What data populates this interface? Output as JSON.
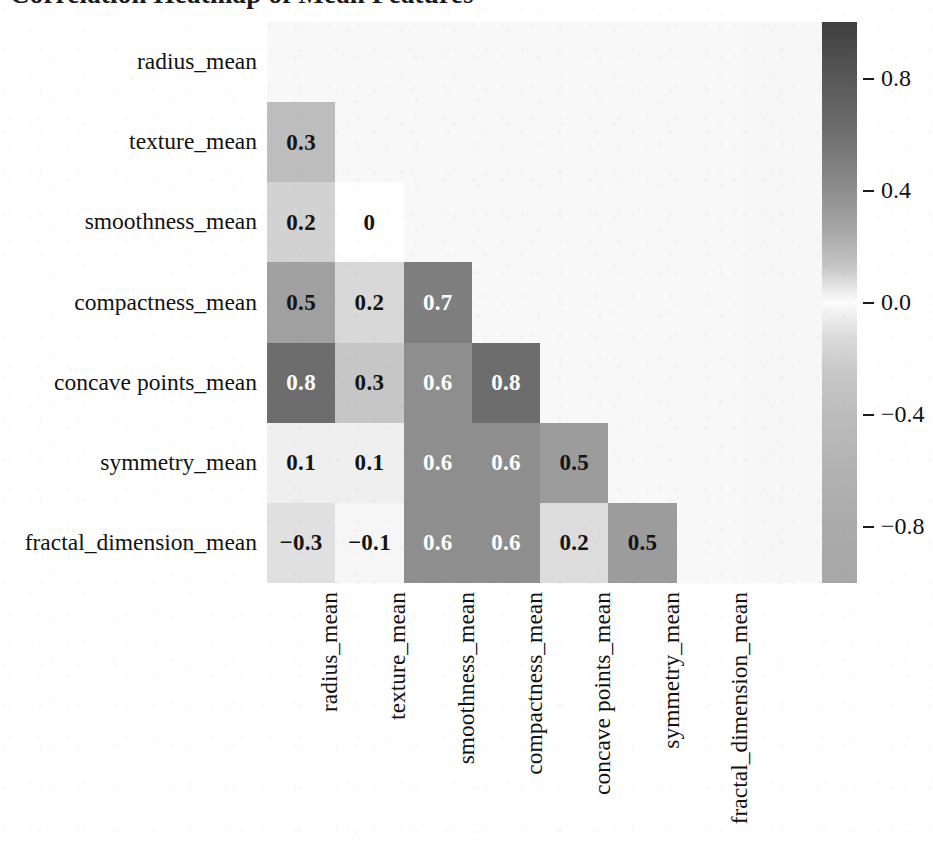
{
  "title": "Correlation Heatmap of Mean Features",
  "chart_data": {
    "type": "heatmap",
    "title": "Correlation Heatmap of Mean Features",
    "xlabel": "",
    "ylabel": "",
    "grid": false,
    "mask": "lower-triangle (diagonal and upper triangle hidden)",
    "colormap": "diverging grayscale (white at 0, dark at +1, gray at -1)",
    "colorbar": {
      "position": "right",
      "vmin": -1.0,
      "vmax": 1.0,
      "ticks": [
        "0.8",
        "0.4",
        "0.0",
        "-0.4",
        "-0.8"
      ],
      "tick_values": [
        0.8,
        0.4,
        0.0,
        -0.4,
        -0.8
      ]
    },
    "categories": [
      "radius_mean",
      "texture_mean",
      "smoothness_mean",
      "compactness_mean",
      "concave points_mean",
      "symmetry_mean",
      "fractal_dimension_mean"
    ],
    "row_labels": [
      "radius_mean",
      "texture_mean",
      "smoothness_mean",
      "compactness_mean",
      "concave points_mean",
      "symmetry_mean",
      "fractal_dimension_mean"
    ],
    "column_labels": [
      "radius_mean",
      "texture_mean",
      "smoothness_mean",
      "compactness_mean",
      "concave points_mean",
      "symmetry_mean",
      "fractal_dimension_mean"
    ],
    "matrix": [
      [
        null,
        null,
        null,
        null,
        null,
        null,
        null
      ],
      [
        0.3,
        null,
        null,
        null,
        null,
        null,
        null
      ],
      [
        0.2,
        0.0,
        null,
        null,
        null,
        null,
        null
      ],
      [
        0.5,
        0.2,
        0.7,
        null,
        null,
        null,
        null
      ],
      [
        0.8,
        0.3,
        0.6,
        0.8,
        null,
        null,
        null
      ],
      [
        0.1,
        0.1,
        0.6,
        0.6,
        0.5,
        null,
        null
      ],
      [
        -0.3,
        -0.1,
        0.6,
        0.6,
        0.2,
        0.5,
        null
      ]
    ],
    "cells": [
      {
        "row": 1,
        "col": 0,
        "label": "0.3",
        "value": 0.3,
        "color": "#bdbdbd",
        "text_color": "#141414"
      },
      {
        "row": 2,
        "col": 0,
        "label": "0.2",
        "value": 0.2,
        "color": "#d2d2d2",
        "text_color": "#141414"
      },
      {
        "row": 2,
        "col": 1,
        "label": "0",
        "value": 0.0,
        "color": "#ffffff",
        "text_color": "#141414"
      },
      {
        "row": 3,
        "col": 0,
        "label": "0.5",
        "value": 0.5,
        "color": "#a0a0a0",
        "text_color": "#141414"
      },
      {
        "row": 3,
        "col": 1,
        "label": "0.2",
        "value": 0.2,
        "color": "#d8d8d8",
        "text_color": "#141414"
      },
      {
        "row": 3,
        "col": 2,
        "label": "0.7",
        "value": 0.7,
        "color": "#7f7f7f",
        "text_color": "#ffffff"
      },
      {
        "row": 4,
        "col": 0,
        "label": "0.8",
        "value": 0.8,
        "color": "#6d6d6d",
        "text_color": "#ffffff"
      },
      {
        "row": 4,
        "col": 1,
        "label": "0.3",
        "value": 0.3,
        "color": "#c6c6c6",
        "text_color": "#141414"
      },
      {
        "row": 4,
        "col": 2,
        "label": "0.6",
        "value": 0.6,
        "color": "#8e8e8e",
        "text_color": "#ffffff"
      },
      {
        "row": 4,
        "col": 3,
        "label": "0.8",
        "value": 0.8,
        "color": "#6d6d6d",
        "text_color": "#ffffff"
      },
      {
        "row": 5,
        "col": 0,
        "label": "0.1",
        "value": 0.1,
        "color": "#efefef",
        "text_color": "#141414"
      },
      {
        "row": 5,
        "col": 1,
        "label": "0.1",
        "value": 0.1,
        "color": "#efefef",
        "text_color": "#141414"
      },
      {
        "row": 5,
        "col": 2,
        "label": "0.6",
        "value": 0.6,
        "color": "#8e8e8e",
        "text_color": "#ffffff"
      },
      {
        "row": 5,
        "col": 3,
        "label": "0.6",
        "value": 0.6,
        "color": "#8e8e8e",
        "text_color": "#ffffff"
      },
      {
        "row": 5,
        "col": 4,
        "label": "0.5",
        "value": 0.5,
        "color": "#9c9c9c",
        "text_color": "#141414"
      },
      {
        "row": 6,
        "col": 0,
        "label": "−0.3",
        "value": -0.3,
        "color": "#e0e0e0",
        "text_color": "#141414"
      },
      {
        "row": 6,
        "col": 1,
        "label": "−0.1",
        "value": -0.1,
        "color": "#f6f6f6",
        "text_color": "#141414"
      },
      {
        "row": 6,
        "col": 2,
        "label": "0.6",
        "value": 0.6,
        "color": "#8e8e8e",
        "text_color": "#ffffff"
      },
      {
        "row": 6,
        "col": 3,
        "label": "0.6",
        "value": 0.6,
        "color": "#8e8e8e",
        "text_color": "#ffffff"
      },
      {
        "row": 6,
        "col": 4,
        "label": "0.2",
        "value": 0.2,
        "color": "#dcdcdc",
        "text_color": "#141414"
      },
      {
        "row": 6,
        "col": 5,
        "label": "0.5",
        "value": 0.5,
        "color": "#9c9c9c",
        "text_color": "#141414"
      }
    ]
  }
}
